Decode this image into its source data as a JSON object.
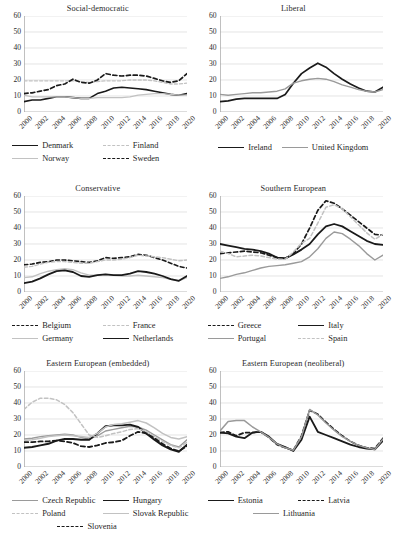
{
  "figure": {
    "panels_across": 2,
    "panels_down": 3,
    "y_axis": {
      "ticks": [
        0,
        10,
        20,
        30,
        40,
        50,
        60
      ],
      "min": 0,
      "max": 60,
      "grid": true
    },
    "x_axis": {
      "ticks": [
        "2000",
        "2002",
        "2004",
        "2006",
        "2008",
        "2010",
        "2012",
        "2014",
        "2016",
        "2018",
        "2020"
      ],
      "min": 2000,
      "max": 2020,
      "tick_rotation": -45
    }
  },
  "colors": {
    "black": "#1a1a1a",
    "gray": "#9a9a9a",
    "light_gray": "#c2c2c2",
    "grid": "#d9d9d9",
    "axis": "#a6a6a6",
    "text": "#2b2b2b"
  },
  "chart_data": [
    {
      "type": "line",
      "title": "Social-democratic",
      "xlabel": "",
      "ylabel": "",
      "ylim": [
        0,
        60
      ],
      "grid": true,
      "legend_position": "bottom",
      "x": [
        2000,
        2001,
        2002,
        2003,
        2004,
        2005,
        2006,
        2007,
        2008,
        2009,
        2010,
        2011,
        2012,
        2013,
        2014,
        2015,
        2016,
        2017,
        2018,
        2019,
        2020
      ],
      "series": [
        {
          "name": "Denmark",
          "style": "solid",
          "color": "#1a1a1a",
          "width": 1.6,
          "values": [
            6.5,
            7.5,
            7.5,
            8.5,
            9.5,
            9.5,
            9.0,
            8.5,
            8.5,
            11.5,
            13.0,
            15.0,
            15.5,
            15.0,
            14.5,
            14.0,
            13.0,
            12.0,
            11.0,
            10.5,
            11.5
          ]
        },
        {
          "name": "Finland",
          "style": "dashed",
          "color": "#c2c2c2",
          "width": 1.3,
          "values": [
            19.5,
            19.5,
            19.5,
            19.5,
            19.5,
            19.5,
            19.5,
            19.0,
            18.5,
            19.0,
            19.5,
            19.5,
            19.5,
            20.0,
            20.0,
            20.0,
            19.5,
            18.5,
            17.5,
            17.5,
            18.0
          ]
        },
        {
          "name": "Norway",
          "style": "solid",
          "color": "#c2c2c2",
          "width": 1.3,
          "values": [
            10.5,
            9.5,
            9.5,
            9.5,
            9.5,
            9.5,
            9.0,
            8.5,
            8.5,
            9.0,
            9.0,
            9.0,
            9.0,
            9.5,
            10.5,
            11.0,
            11.5,
            11.5,
            11.0,
            10.5,
            10.5
          ]
        },
        {
          "name": "Sweden",
          "style": "dashed",
          "color": "#1a1a1a",
          "width": 1.7,
          "values": [
            11.5,
            12.0,
            13.0,
            14.0,
            16.5,
            17.5,
            20.5,
            18.5,
            18.0,
            20.0,
            24.0,
            23.0,
            22.5,
            23.0,
            23.0,
            22.5,
            21.0,
            19.5,
            18.5,
            19.5,
            24.0
          ]
        }
      ]
    },
    {
      "type": "line",
      "title": "Liberal",
      "xlabel": "",
      "ylabel": "",
      "ylim": [
        0,
        60
      ],
      "grid": true,
      "legend_position": "bottom",
      "x": [
        2000,
        2001,
        2002,
        2003,
        2004,
        2005,
        2006,
        2007,
        2008,
        2009,
        2010,
        2011,
        2012,
        2013,
        2014,
        2015,
        2016,
        2017,
        2018,
        2019,
        2020
      ],
      "series": [
        {
          "name": "Ireland",
          "style": "solid",
          "color": "#1a1a1a",
          "width": 1.7,
          "values": [
            6.5,
            7.0,
            8.0,
            8.5,
            8.5,
            8.5,
            8.5,
            8.5,
            11.0,
            18.0,
            24.0,
            27.5,
            30.5,
            28.0,
            24.0,
            20.5,
            17.5,
            15.0,
            13.0,
            12.5,
            15.5
          ]
        },
        {
          "name": "United Kingdom",
          "style": "solid",
          "color": "#9a9a9a",
          "width": 1.4,
          "values": [
            11.0,
            10.5,
            11.0,
            11.5,
            12.0,
            12.0,
            12.5,
            13.0,
            14.5,
            18.0,
            19.5,
            20.5,
            21.0,
            20.5,
            19.0,
            17.0,
            15.5,
            14.0,
            13.0,
            12.5,
            14.0
          ]
        }
      ]
    },
    {
      "type": "line",
      "title": "Conservative",
      "xlabel": "",
      "ylabel": "",
      "ylim": [
        0,
        60
      ],
      "grid": true,
      "legend_position": "bottom",
      "x": [
        2000,
        2001,
        2002,
        2003,
        2004,
        2005,
        2006,
        2007,
        2008,
        2009,
        2010,
        2011,
        2012,
        2013,
        2014,
        2015,
        2016,
        2017,
        2018,
        2019,
        2020
      ],
      "series": [
        {
          "name": "Belgium",
          "style": "dashed",
          "color": "#1a1a1a",
          "width": 1.6,
          "values": [
            17.0,
            17.5,
            18.5,
            19.0,
            20.0,
            20.0,
            19.5,
            19.0,
            18.5,
            19.5,
            21.5,
            21.0,
            21.5,
            22.0,
            23.5,
            23.0,
            21.5,
            20.0,
            18.0,
            16.0,
            15.0
          ]
        },
        {
          "name": "France",
          "style": "dashed",
          "color": "#c2c2c2",
          "width": 1.4,
          "values": [
            15.5,
            16.0,
            17.5,
            18.5,
            19.0,
            19.0,
            18.5,
            18.0,
            18.0,
            19.0,
            20.0,
            20.0,
            20.5,
            21.5,
            23.0,
            22.5,
            22.0,
            21.5,
            20.5,
            19.5,
            20.0
          ]
        },
        {
          "name": "Germany",
          "style": "solid",
          "color": "#c2c2c2",
          "width": 1.4,
          "values": [
            9.0,
            9.5,
            11.5,
            13.0,
            14.0,
            14.5,
            14.0,
            12.0,
            10.5,
            10.5,
            11.0,
            10.5,
            10.0,
            10.0,
            10.5,
            10.0,
            9.5,
            9.0,
            8.0,
            7.0,
            9.0
          ]
        },
        {
          "name": "Netherlands",
          "style": "solid",
          "color": "#1a1a1a",
          "width": 1.8,
          "values": [
            5.5,
            6.5,
            8.5,
            11.0,
            13.0,
            13.5,
            12.5,
            10.0,
            9.5,
            10.5,
            11.0,
            10.5,
            10.5,
            11.5,
            13.0,
            12.5,
            11.5,
            10.0,
            8.0,
            7.0,
            10.0
          ]
        }
      ]
    },
    {
      "type": "line",
      "title": "Southern European",
      "xlabel": "",
      "ylabel": "",
      "ylim": [
        0,
        60
      ],
      "grid": true,
      "legend_position": "bottom",
      "x": [
        2000,
        2001,
        2002,
        2003,
        2004,
        2005,
        2006,
        2007,
        2008,
        2009,
        2010,
        2011,
        2012,
        2013,
        2014,
        2015,
        2016,
        2017,
        2018,
        2019,
        2020
      ],
      "series": [
        {
          "name": "Greece",
          "style": "dashed",
          "color": "#1a1a1a",
          "width": 1.7,
          "values": [
            24.0,
            24.5,
            25.0,
            25.5,
            25.0,
            24.5,
            23.0,
            21.5,
            21.0,
            24.0,
            30.0,
            40.0,
            51.0,
            57.0,
            55.5,
            52.0,
            48.0,
            44.0,
            40.0,
            36.0,
            35.5
          ]
        },
        {
          "name": "Italy",
          "style": "solid",
          "color": "#1a1a1a",
          "width": 1.8,
          "values": [
            30.0,
            29.0,
            28.0,
            27.0,
            26.5,
            25.5,
            24.0,
            21.5,
            21.0,
            23.5,
            26.5,
            30.0,
            36.0,
            41.0,
            42.5,
            41.0,
            38.0,
            35.0,
            32.0,
            30.0,
            29.5
          ]
        },
        {
          "name": "Portugal",
          "style": "solid",
          "color": "#9a9a9a",
          "width": 1.4,
          "values": [
            8.5,
            9.5,
            11.0,
            12.0,
            13.5,
            15.0,
            16.0,
            16.5,
            17.0,
            18.0,
            19.0,
            22.0,
            27.0,
            33.5,
            37.5,
            36.5,
            33.0,
            29.0,
            24.0,
            20.0,
            23.0
          ]
        },
        {
          "name": "Spain",
          "style": "dashed",
          "color": "#c2c2c2",
          "width": 1.5,
          "values": [
            25.5,
            24.0,
            22.0,
            22.5,
            23.0,
            22.5,
            21.5,
            20.5,
            20.5,
            25.0,
            30.5,
            33.5,
            43.0,
            53.0,
            54.5,
            52.0,
            47.0,
            42.0,
            37.0,
            33.0,
            36.0
          ]
        }
      ]
    },
    {
      "type": "line",
      "title": "Eastern European (embedded)",
      "xlabel": "",
      "ylabel": "",
      "ylim": [
        0,
        60
      ],
      "grid": true,
      "legend_position": "bottom",
      "x": [
        2000,
        2001,
        2002,
        2003,
        2004,
        2005,
        2006,
        2007,
        2008,
        2009,
        2010,
        2011,
        2012,
        2013,
        2014,
        2015,
        2016,
        2017,
        2018,
        2019,
        2020
      ],
      "series": [
        {
          "name": "Czech Republic",
          "style": "solid",
          "color": "#9a9a9a",
          "width": 1.4,
          "values": [
            17.5,
            18.0,
            19.0,
            19.5,
            20.0,
            20.5,
            20.0,
            18.5,
            17.5,
            19.5,
            22.5,
            23.5,
            24.5,
            25.5,
            25.0,
            23.0,
            20.0,
            17.0,
            14.0,
            12.5,
            17.0
          ]
        },
        {
          "name": "Hungary",
          "style": "solid",
          "color": "#1a1a1a",
          "width": 1.9,
          "values": [
            12.0,
            12.5,
            13.5,
            14.5,
            16.5,
            17.5,
            17.5,
            17.0,
            17.0,
            21.0,
            25.5,
            26.0,
            26.0,
            26.5,
            25.0,
            21.0,
            17.0,
            13.5,
            11.0,
            9.5,
            14.0
          ]
        },
        {
          "name": "Poland",
          "style": "dashed",
          "color": "#c2c2c2",
          "width": 1.5,
          "values": [
            36.0,
            40.5,
            43.0,
            43.0,
            42.0,
            39.0,
            34.0,
            27.0,
            20.0,
            18.5,
            19.5,
            21.0,
            22.0,
            23.5,
            24.0,
            22.0,
            19.0,
            16.0,
            13.5,
            12.0,
            15.5
          ]
        },
        {
          "name": "Slovak Republic",
          "style": "solid",
          "color": "#c2c2c2",
          "width": 1.5,
          "values": [
            16.5,
            17.0,
            18.0,
            19.0,
            19.5,
            20.0,
            19.5,
            19.0,
            18.5,
            21.0,
            25.0,
            26.5,
            27.0,
            28.0,
            29.0,
            27.5,
            24.5,
            21.0,
            18.5,
            17.5,
            19.0
          ]
        },
        {
          "name": "Slovenia",
          "style": "dashed",
          "color": "#1a1a1a",
          "width": 1.8,
          "values": [
            15.5,
            15.5,
            16.0,
            16.0,
            16.5,
            16.0,
            15.0,
            13.0,
            12.5,
            13.5,
            15.0,
            15.5,
            16.5,
            19.5,
            22.0,
            21.0,
            18.0,
            14.5,
            11.5,
            10.0,
            13.0
          ]
        }
      ]
    },
    {
      "type": "line",
      "title": "Eastern European (neoliberal)",
      "xlabel": "",
      "ylabel": "",
      "ylim": [
        0,
        60
      ],
      "grid": true,
      "legend_position": "bottom",
      "x": [
        2000,
        2001,
        2002,
        2003,
        2004,
        2005,
        2006,
        2007,
        2008,
        2009,
        2010,
        2011,
        2012,
        2013,
        2014,
        2015,
        2016,
        2017,
        2018,
        2019,
        2020
      ],
      "series": [
        {
          "name": "Estonia",
          "style": "solid",
          "color": "#1a1a1a",
          "width": 1.8,
          "values": [
            21.5,
            21.0,
            19.0,
            18.0,
            21.5,
            22.0,
            19.0,
            14.5,
            12.5,
            10.0,
            17.0,
            31.5,
            22.0,
            20.0,
            18.0,
            16.0,
            14.0,
            12.5,
            11.5,
            11.0,
            16.5
          ]
        },
        {
          "name": "Latvia",
          "style": "dashed",
          "color": "#1a1a1a",
          "width": 1.7,
          "values": [
            21.5,
            22.0,
            19.5,
            21.5,
            21.5,
            22.0,
            18.5,
            14.0,
            12.0,
            10.5,
            19.5,
            35.5,
            33.0,
            28.0,
            23.5,
            19.5,
            16.0,
            13.5,
            12.0,
            11.5,
            18.0
          ]
        },
        {
          "name": "Lithuania",
          "style": "solid",
          "color": "#9a9a9a",
          "width": 1.5,
          "values": [
            22.5,
            28.5,
            29.0,
            29.0,
            25.0,
            22.0,
            18.5,
            14.5,
            12.0,
            10.5,
            19.0,
            36.0,
            32.5,
            27.5,
            23.0,
            19.0,
            16.0,
            13.5,
            12.0,
            11.0,
            17.5
          ]
        }
      ]
    }
  ]
}
